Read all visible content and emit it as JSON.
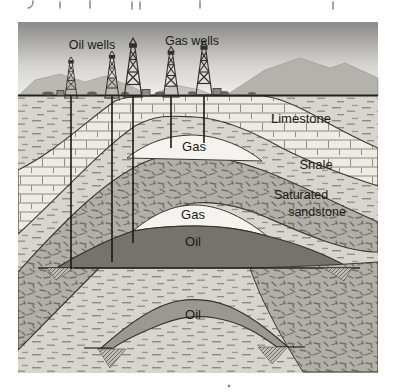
{
  "figure": {
    "type": "geological-cross-section",
    "surface_labels": {
      "oil_wells": "Oil wells",
      "gas_wells": "Gas wells"
    },
    "layer_labels": {
      "limestone": "Limestone",
      "shale": "Shale",
      "saturated_sandstone": [
        "Saturated",
        "sandstone"
      ]
    },
    "deposit_labels": {
      "gas_upper": "Gas",
      "gas_lower": "Gas",
      "oil_upper": "Oil",
      "oil_lower": "Oil"
    },
    "wells": {
      "derrick_count": 5,
      "oil_well_line_count": 3,
      "gas_well_line_count": 2
    },
    "colors": {
      "sky_top": "#8a8a88",
      "sky_bottom": "#efeeea",
      "mountains": "#b5b4af",
      "limestone_fill": "#edebe3",
      "shale_and_water_fill": "#d7d5cd",
      "sandstone_fill": "#b1afa7",
      "gas_zone": "#f4f3ef",
      "oil_upper_zone": "#74736c",
      "oil_lower_zone": "#9a9890",
      "boundary_line": "#3a382f",
      "text": "#1c1b18"
    }
  }
}
